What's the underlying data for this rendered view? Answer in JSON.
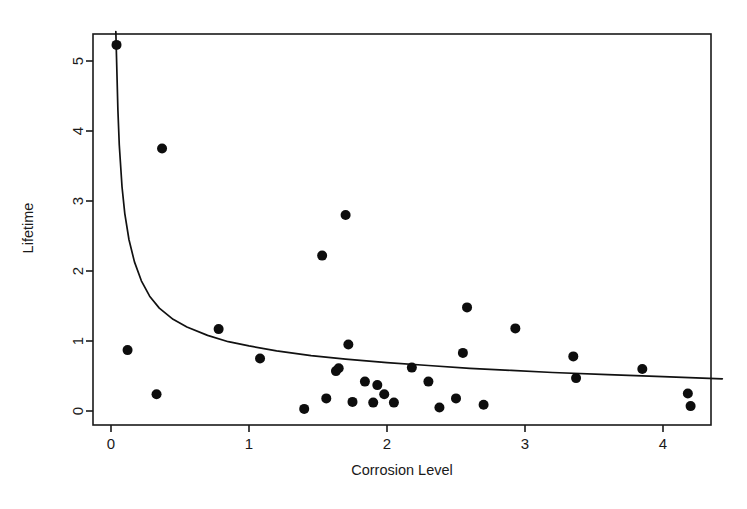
{
  "figure": {
    "background_color": "#ffffff",
    "foreground_color": "#1a1a1a",
    "point_color": "#0d0d0d",
    "curve_color": "#111111"
  },
  "chart_data": {
    "type": "scatter",
    "title": "",
    "subtitle": "",
    "xlabel": "Corrosion Level",
    "ylabel": "Lifetime",
    "xlim": [
      -0.22,
      4.45
    ],
    "ylim": [
      -0.3,
      5.55
    ],
    "xticks": [
      0,
      1,
      2,
      3,
      4
    ],
    "xticklabels": [
      "0",
      "1",
      "2",
      "3",
      "4"
    ],
    "yticks": [
      0,
      1,
      2,
      3,
      4,
      5
    ],
    "yticklabels": [
      "0",
      "1",
      "2",
      "3",
      "4",
      "5"
    ],
    "grid": false,
    "legend": null,
    "legend_position": "none",
    "frame": "box",
    "series": [
      {
        "name": "observations",
        "type": "scatter",
        "marker": "filled-circle",
        "color": "#0d0d0d",
        "points": [
          {
            "x": 0.04,
            "y": 5.23
          },
          {
            "x": 0.12,
            "y": 0.87
          },
          {
            "x": 0.33,
            "y": 0.24
          },
          {
            "x": 0.37,
            "y": 3.75
          },
          {
            "x": 0.78,
            "y": 1.17
          },
          {
            "x": 1.08,
            "y": 0.75
          },
          {
            "x": 1.4,
            "y": 0.03
          },
          {
            "x": 1.53,
            "y": 2.22
          },
          {
            "x": 1.56,
            "y": 0.18
          },
          {
            "x": 1.63,
            "y": 0.57
          },
          {
            "x": 1.65,
            "y": 0.61
          },
          {
            "x": 1.7,
            "y": 2.8
          },
          {
            "x": 1.72,
            "y": 0.95
          },
          {
            "x": 1.75,
            "y": 0.13
          },
          {
            "x": 1.84,
            "y": 0.42
          },
          {
            "x": 1.9,
            "y": 0.12
          },
          {
            "x": 1.93,
            "y": 0.37
          },
          {
            "x": 1.98,
            "y": 0.24
          },
          {
            "x": 2.05,
            "y": 0.12
          },
          {
            "x": 2.18,
            "y": 0.62
          },
          {
            "x": 2.3,
            "y": 0.42
          },
          {
            "x": 2.38,
            "y": 0.05
          },
          {
            "x": 2.5,
            "y": 0.18
          },
          {
            "x": 2.55,
            "y": 0.83
          },
          {
            "x": 2.58,
            "y": 1.48
          },
          {
            "x": 2.7,
            "y": 0.09
          },
          {
            "x": 2.93,
            "y": 1.18
          },
          {
            "x": 3.35,
            "y": 0.78
          },
          {
            "x": 3.37,
            "y": 0.47
          },
          {
            "x": 3.85,
            "y": 0.6
          },
          {
            "x": 4.18,
            "y": 0.25
          },
          {
            "x": 4.2,
            "y": 0.07
          }
        ]
      },
      {
        "name": "fitted-curve",
        "type": "line",
        "color": "#111111",
        "description": "decreasing inverse-power fit through the scatter",
        "points": [
          {
            "x": 0.035,
            "y": 5.42
          },
          {
            "x": 0.04,
            "y": 5.05
          },
          {
            "x": 0.05,
            "y": 4.3
          },
          {
            "x": 0.06,
            "y": 3.8
          },
          {
            "x": 0.08,
            "y": 3.2
          },
          {
            "x": 0.1,
            "y": 2.82
          },
          {
            "x": 0.13,
            "y": 2.45
          },
          {
            "x": 0.17,
            "y": 2.13
          },
          {
            "x": 0.22,
            "y": 1.86
          },
          {
            "x": 0.28,
            "y": 1.64
          },
          {
            "x": 0.35,
            "y": 1.47
          },
          {
            "x": 0.45,
            "y": 1.31
          },
          {
            "x": 0.55,
            "y": 1.2
          },
          {
            "x": 0.7,
            "y": 1.08
          },
          {
            "x": 0.85,
            "y": 0.99
          },
          {
            "x": 1.0,
            "y": 0.93
          },
          {
            "x": 1.2,
            "y": 0.86
          },
          {
            "x": 1.45,
            "y": 0.79
          },
          {
            "x": 1.7,
            "y": 0.74
          },
          {
            "x": 2.0,
            "y": 0.69
          },
          {
            "x": 2.3,
            "y": 0.65
          },
          {
            "x": 2.6,
            "y": 0.61
          },
          {
            "x": 2.9,
            "y": 0.58
          },
          {
            "x": 3.2,
            "y": 0.55
          },
          {
            "x": 3.6,
            "y": 0.52
          },
          {
            "x": 4.0,
            "y": 0.49
          },
          {
            "x": 4.43,
            "y": 0.46
          }
        ]
      }
    ]
  },
  "geometry": {
    "plot_left": 93,
    "plot_right": 711,
    "plot_top": 34,
    "plot_bottom": 425,
    "x_zero_px": 111,
    "x_unit_px": 138,
    "y_zero_px": 411,
    "y_unit_px": 70,
    "tick_length": 7,
    "point_radius": 5.0
  }
}
